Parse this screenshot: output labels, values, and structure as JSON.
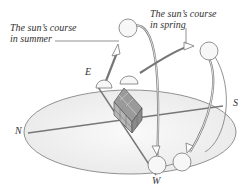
{
  "diagram": {
    "labels": {
      "summer_line1": "The sun’s course",
      "summer_line2": "in summer",
      "spring_line1": "The sun’s course",
      "spring_line2": "in spring"
    },
    "directions": {
      "east": "E",
      "west": "W",
      "north": "N",
      "south": "S"
    },
    "colors": {
      "line": "#666666",
      "ground_fill": "#f2f2f2",
      "sun_fill": "#f7f7f7",
      "house": "#888888"
    }
  }
}
